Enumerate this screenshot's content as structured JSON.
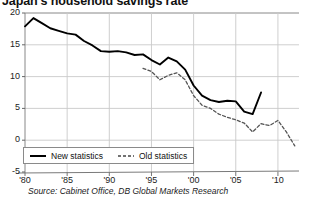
{
  "chart_data": {
    "type": "line",
    "title": "Japan's household savings rate",
    "xlabel": "",
    "ylabel": "",
    "xlim": [
      1980,
      2012.5
    ],
    "ylim": [
      -5,
      20
    ],
    "grid": true,
    "legend_position": "bottom-left",
    "source": "Source: Cabinet Office, DB Global Markets Research",
    "yticks": [
      20,
      15,
      10,
      5,
      0,
      -5
    ],
    "ytick_labels": [
      "20",
      "15",
      "10",
      "5",
      "0",
      "-5"
    ],
    "xticks": [
      1980,
      1985,
      1990,
      1995,
      2000,
      2005,
      2010
    ],
    "xtick_labels": [
      "'80",
      "'85",
      "'90",
      "'95",
      "'00",
      "'05",
      "'10"
    ],
    "series": [
      {
        "name": "New statistics",
        "style": "solid",
        "color": "#000000",
        "x": [
          1980,
          1981,
          1982,
          1983,
          1984,
          1985,
          1986,
          1987,
          1988,
          1989,
          1990,
          1991,
          1992,
          1993,
          1994,
          1995,
          1996,
          1997,
          1998,
          1999,
          2000,
          2001,
          2002,
          2003,
          2004,
          2005,
          2006,
          2007,
          2008
        ],
        "values": [
          17.9,
          19.2,
          18.4,
          17.6,
          17.2,
          16.8,
          16.6,
          15.6,
          14.9,
          14.0,
          13.9,
          14.0,
          13.8,
          13.4,
          13.5,
          12.6,
          11.9,
          13.0,
          12.4,
          11.1,
          8.6,
          7.0,
          6.3,
          6.0,
          6.2,
          6.1,
          4.5,
          4.1,
          7.5
        ]
      },
      {
        "name": "Old statistics",
        "style": "dashed",
        "color": "#555555",
        "x": [
          1994,
          1995,
          1996,
          1997,
          1998,
          1999,
          2000,
          2001,
          2002,
          2003,
          2004,
          2005,
          2006,
          2007,
          2008,
          2009,
          2010,
          2011,
          2012
        ],
        "values": [
          11.3,
          10.8,
          9.5,
          10.2,
          10.6,
          9.5,
          7.0,
          5.5,
          5.0,
          4.1,
          3.6,
          3.2,
          2.7,
          1.3,
          2.6,
          2.3,
          3.1,
          1.3,
          -0.9
        ]
      }
    ]
  }
}
